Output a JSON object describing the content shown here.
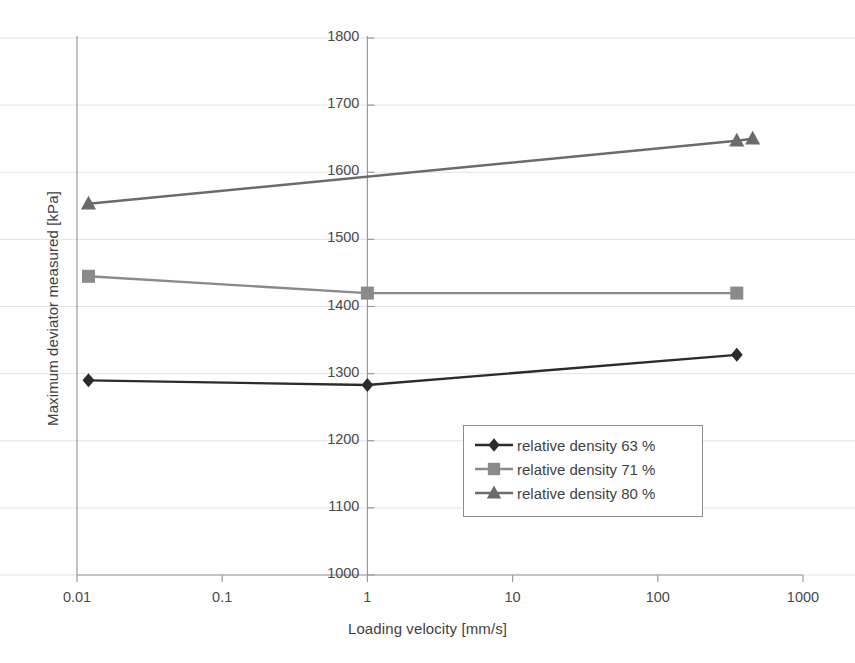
{
  "chart_data": {
    "type": "line",
    "title": "",
    "xlabel": "Loading velocity [mm/s]",
    "ylabel": "Maximum deviator measured [kPa]",
    "xscale": "log",
    "yscale": "linear",
    "xlim": [
      0.01,
      1000
    ],
    "ylim": [
      1000,
      1800
    ],
    "yticks": [
      1000,
      1100,
      1200,
      1300,
      1400,
      1500,
      1600,
      1700,
      1800
    ],
    "ytick_labels": [
      "1000",
      "1100",
      "1200",
      "1300",
      "1400",
      "1500",
      "1600",
      "1700",
      "1800"
    ],
    "xticks": [
      0.01,
      0.1,
      1,
      10,
      100,
      1000
    ],
    "xtick_labels": [
      "0.01",
      "0.1",
      "1",
      "10",
      "100",
      "1000"
    ],
    "grid": "horizontal",
    "legend_position": "inside-lower-right",
    "series": [
      {
        "name": "relative density 63 %",
        "marker": "diamond",
        "color": "#2b2b2b",
        "points": [
          {
            "x": 0.012,
            "y": 1290
          },
          {
            "x": 1,
            "y": 1283
          },
          {
            "x": 350,
            "y": 1328
          }
        ]
      },
      {
        "name": "relative density 71 %",
        "marker": "square",
        "color": "#8a8a8a",
        "points": [
          {
            "x": 0.012,
            "y": 1445
          },
          {
            "x": 1,
            "y": 1420
          },
          {
            "x": 350,
            "y": 1420
          }
        ]
      },
      {
        "name": "relative density 80 %",
        "marker": "triangle",
        "color": "#6b6b6b",
        "points": [
          {
            "x": 0.012,
            "y": 1553
          },
          {
            "x": 350,
            "y": 1647
          },
          {
            "x": 450,
            "y": 1650
          }
        ]
      }
    ]
  },
  "legend": {
    "entries": [
      {
        "label": "relative density 63 %"
      },
      {
        "label": "relative density 71 %"
      },
      {
        "label": "relative density 80 %"
      }
    ]
  },
  "axes": {
    "y_title": "Maximum deviator measured [kPa]",
    "x_title": "Loading velocity [mm/s]"
  },
  "colors": {
    "series_63": "#2b2b2b",
    "series_71": "#8a8a8a",
    "series_80": "#6b6b6b",
    "axis": "#9a9a9a",
    "grid": "#e2e2ea",
    "text": "#3f3f3f"
  }
}
